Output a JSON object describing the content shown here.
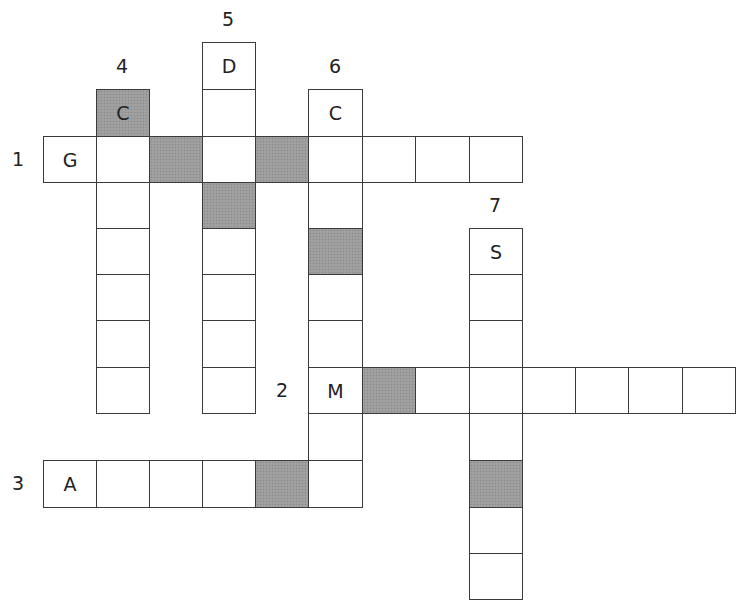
{
  "puzzle": {
    "grid": {
      "col_edges": [
        43,
        96,
        149,
        202,
        255,
        308,
        362,
        415,
        469,
        522,
        575,
        628,
        682,
        735
      ],
      "row_edges": [
        42,
        89,
        136,
        182,
        228,
        274,
        320,
        367,
        413,
        460,
        507,
        553,
        599
      ],
      "shade_color": "#9c9c9c",
      "border_color": "#3a3a3a"
    },
    "clue_numbers": [
      {
        "label": "1",
        "x": 18,
        "y": 159,
        "for": "1-across"
      },
      {
        "label": "2",
        "x": 282,
        "y": 390,
        "for": "2-across"
      },
      {
        "label": "3",
        "x": 18,
        "y": 483,
        "for": "3-across"
      },
      {
        "label": "4",
        "x": 122,
        "y": 66,
        "for": "4-down"
      },
      {
        "label": "5",
        "x": 228,
        "y": 19,
        "for": "5-down"
      },
      {
        "label": "6",
        "x": 335,
        "y": 66,
        "for": "6-down"
      },
      {
        "label": "7",
        "x": 495,
        "y": 205,
        "for": "7-down"
      }
    ],
    "words": [
      {
        "id": "1-across",
        "number": "1",
        "direction": "across",
        "start_letter": "G",
        "length": 9
      },
      {
        "id": "2-across",
        "number": "2",
        "direction": "across",
        "start_letter": "M",
        "length": 8
      },
      {
        "id": "3-across",
        "number": "3",
        "direction": "across",
        "start_letter": "A",
        "length": 6
      },
      {
        "id": "4-down",
        "number": "4",
        "direction": "down",
        "start_letter": "C",
        "length": 7
      },
      {
        "id": "5-down",
        "number": "5",
        "direction": "down",
        "start_letter": "D",
        "length": 8
      },
      {
        "id": "6-down",
        "number": "6",
        "direction": "down",
        "start_letter": "C",
        "length": 9
      },
      {
        "id": "7-down",
        "number": "7",
        "direction": "down",
        "start_letter": "S",
        "length": 8
      }
    ],
    "cells": [
      {
        "r": 0,
        "c": 3,
        "letter": "D",
        "shaded": false
      },
      {
        "r": 1,
        "c": 1,
        "letter": "C",
        "shaded": true
      },
      {
        "r": 1,
        "c": 3,
        "letter": "",
        "shaded": false
      },
      {
        "r": 1,
        "c": 5,
        "letter": "C",
        "shaded": false
      },
      {
        "r": 2,
        "c": 0,
        "letter": "G",
        "shaded": false
      },
      {
        "r": 2,
        "c": 1,
        "letter": "",
        "shaded": false
      },
      {
        "r": 2,
        "c": 2,
        "letter": "",
        "shaded": true
      },
      {
        "r": 2,
        "c": 3,
        "letter": "",
        "shaded": false
      },
      {
        "r": 2,
        "c": 4,
        "letter": "",
        "shaded": true
      },
      {
        "r": 2,
        "c": 5,
        "letter": "",
        "shaded": false
      },
      {
        "r": 2,
        "c": 6,
        "letter": "",
        "shaded": false
      },
      {
        "r": 2,
        "c": 7,
        "letter": "",
        "shaded": false
      },
      {
        "r": 2,
        "c": 8,
        "letter": "",
        "shaded": false
      },
      {
        "r": 3,
        "c": 1,
        "letter": "",
        "shaded": false
      },
      {
        "r": 3,
        "c": 3,
        "letter": "",
        "shaded": true
      },
      {
        "r": 3,
        "c": 5,
        "letter": "",
        "shaded": false
      },
      {
        "r": 4,
        "c": 1,
        "letter": "",
        "shaded": false
      },
      {
        "r": 4,
        "c": 3,
        "letter": "",
        "shaded": false
      },
      {
        "r": 4,
        "c": 5,
        "letter": "",
        "shaded": true
      },
      {
        "r": 4,
        "c": 8,
        "letter": "S",
        "shaded": false
      },
      {
        "r": 5,
        "c": 1,
        "letter": "",
        "shaded": false
      },
      {
        "r": 5,
        "c": 3,
        "letter": "",
        "shaded": false
      },
      {
        "r": 5,
        "c": 5,
        "letter": "",
        "shaded": false
      },
      {
        "r": 5,
        "c": 8,
        "letter": "",
        "shaded": false
      },
      {
        "r": 6,
        "c": 1,
        "letter": "",
        "shaded": false
      },
      {
        "r": 6,
        "c": 3,
        "letter": "",
        "shaded": false
      },
      {
        "r": 6,
        "c": 5,
        "letter": "",
        "shaded": false
      },
      {
        "r": 6,
        "c": 8,
        "letter": "",
        "shaded": false
      },
      {
        "r": 7,
        "c": 1,
        "letter": "",
        "shaded": false
      },
      {
        "r": 7,
        "c": 3,
        "letter": "",
        "shaded": false
      },
      {
        "r": 7,
        "c": 5,
        "letter": "M",
        "shaded": false
      },
      {
        "r": 7,
        "c": 6,
        "letter": "",
        "shaded": true
      },
      {
        "r": 7,
        "c": 7,
        "letter": "",
        "shaded": false
      },
      {
        "r": 7,
        "c": 8,
        "letter": "",
        "shaded": false
      },
      {
        "r": 7,
        "c": 9,
        "letter": "",
        "shaded": false
      },
      {
        "r": 7,
        "c": 10,
        "letter": "",
        "shaded": false
      },
      {
        "r": 7,
        "c": 11,
        "letter": "",
        "shaded": false
      },
      {
        "r": 7,
        "c": 12,
        "letter": "",
        "shaded": false
      },
      {
        "r": 8,
        "c": 5,
        "letter": "",
        "shaded": false
      },
      {
        "r": 8,
        "c": 8,
        "letter": "",
        "shaded": false
      },
      {
        "r": 9,
        "c": 0,
        "letter": "A",
        "shaded": false
      },
      {
        "r": 9,
        "c": 1,
        "letter": "",
        "shaded": false
      },
      {
        "r": 9,
        "c": 2,
        "letter": "",
        "shaded": false
      },
      {
        "r": 9,
        "c": 3,
        "letter": "",
        "shaded": false
      },
      {
        "r": 9,
        "c": 4,
        "letter": "",
        "shaded": true
      },
      {
        "r": 9,
        "c": 5,
        "letter": "",
        "shaded": false
      },
      {
        "r": 9,
        "c": 8,
        "letter": "",
        "shaded": true
      },
      {
        "r": 10,
        "c": 8,
        "letter": "",
        "shaded": false
      },
      {
        "r": 11,
        "c": 8,
        "letter": "",
        "shaded": false
      }
    ]
  }
}
